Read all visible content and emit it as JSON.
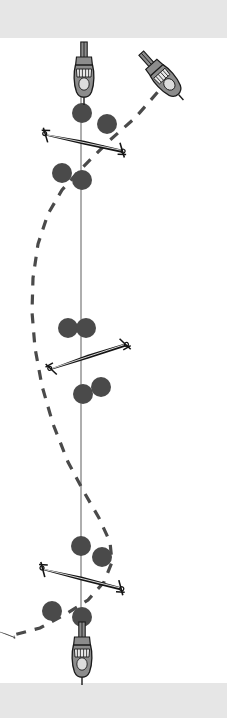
{
  "scene": {
    "title": "two-body orbit simulation viewport",
    "width": 227,
    "height": 718,
    "background_color": "#ffffff",
    "band_color": "#e6e6e6",
    "axis_color": "#9a9a9a",
    "trajectory_color": "#4a4a4a",
    "node_color": "#4a4a4a",
    "craft_body_color": "#8c8c8c",
    "craft_outline_color": "#1a1a1a",
    "glider_color": "#111111"
  },
  "bands": {
    "top": {
      "label": "letterbox-band-top",
      "y": 0,
      "height": 38
    },
    "bottom": {
      "label": "letterbox-band-bottom",
      "y": 683,
      "height": 35
    }
  },
  "axis": {
    "label": "vertical-reference-axis",
    "x": 81,
    "y_start": 96,
    "y_end": 632,
    "color": "#9a9a9a",
    "width": 1.6
  },
  "trajectory": {
    "label": "dashed-trajectory-curve",
    "color": "#4a4a4a",
    "width": 3.2,
    "dash": "10 9",
    "path": "M 170 78 L 135 118 L 110 140 L 92 158 L 78 172 L 62 190 L 48 214 L 38 244 L 33 278 L 32 312 L 35 348 L 42 386 L 53 424 L 68 462 L 84 492 L 99 518 L 110 542 L 112 562 L 104 582 L 88 600 L 66 614 L 40 628 L 10 636"
  },
  "craft": [
    {
      "name": "craft-top-vertical",
      "x": 84,
      "y": 70,
      "rotation": 0,
      "scale": 1.0
    },
    {
      "name": "craft-top-right-diagonal",
      "x": 160,
      "y": 74,
      "rotation": -42,
      "scale": 1.0
    },
    {
      "name": "craft-bottom-vertical",
      "x": 82,
      "y": 650,
      "rotation": 0,
      "scale": 1.0
    }
  ],
  "gliders": [
    {
      "name": "glider-bar-upper",
      "cx": 84,
      "cy": 142,
      "length": 78,
      "rotation": 14
    },
    {
      "name": "glider-bar-middle",
      "cx": 88,
      "cy": 356,
      "length": 78,
      "rotation": -16
    },
    {
      "name": "glider-bar-lower",
      "cx": 82,
      "cy": 578,
      "length": 80,
      "rotation": 16
    },
    {
      "name": "glider-edge-left",
      "cx": 6,
      "cy": 634,
      "length": 18,
      "rotation": 22
    }
  ],
  "nodes": [
    {
      "name": "node-upper-axis",
      "cx": 82,
      "cy": 113,
      "r": 10
    },
    {
      "name": "node-upper-offaxis",
      "cx": 107,
      "cy": 124,
      "r": 10
    },
    {
      "name": "node-upper-left",
      "cx": 62,
      "cy": 173,
      "r": 10
    },
    {
      "name": "node-upper-axis-lower",
      "cx": 82,
      "cy": 180,
      "r": 10
    },
    {
      "name": "node-mid-left",
      "cx": 68,
      "cy": 328,
      "r": 10
    },
    {
      "name": "node-mid-axis-upper",
      "cx": 86,
      "cy": 328,
      "r": 10
    },
    {
      "name": "node-mid-axis-lower",
      "cx": 83,
      "cy": 394,
      "r": 10
    },
    {
      "name": "node-mid-right",
      "cx": 101,
      "cy": 387,
      "r": 10
    },
    {
      "name": "node-lower-axis",
      "cx": 81,
      "cy": 546,
      "r": 10
    },
    {
      "name": "node-lower-right",
      "cx": 102,
      "cy": 557,
      "r": 10
    },
    {
      "name": "node-lower-left",
      "cx": 52,
      "cy": 611,
      "r": 10
    },
    {
      "name": "node-lower-axis-bottom",
      "cx": 82,
      "cy": 617,
      "r": 10
    }
  ]
}
